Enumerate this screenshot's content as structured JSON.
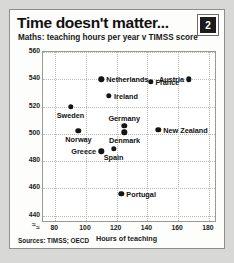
{
  "figure": {
    "title": "Time doesn't matter...",
    "badge": "2",
    "subtitle": "Maths: teaching hours per year v TIMSS score",
    "source": "Sources: TIMSS; OECD",
    "break_symbol": "≈"
  },
  "chart_data": {
    "type": "scatter",
    "title": "Time doesn't matter...",
    "subtitle": "Maths: teaching hours per year v TIMSS score",
    "xlabel": "Hours of teaching",
    "ylabel": "TIMSS score",
    "xlim": [
      72,
      184
    ],
    "ylim": [
      436,
      560
    ],
    "xticks": [
      80,
      100,
      120,
      140,
      160,
      180
    ],
    "yticks": [
      440,
      460,
      480,
      500,
      520,
      540,
      560
    ],
    "grid": true,
    "legend": "none",
    "axis_break": true,
    "points": [
      {
        "label": "Netherlands",
        "x": 110,
        "y": 540,
        "label_pos": "right"
      },
      {
        "label": "Austria",
        "x": 167,
        "y": 540,
        "label_pos": "left"
      },
      {
        "label": "Ireland",
        "x": 115,
        "y": 528,
        "label_pos": "right"
      },
      {
        "label": "France",
        "x": 142,
        "y": 538,
        "label_pos": "right"
      },
      {
        "label": "Sweden",
        "x": 90,
        "y": 520,
        "label_pos": "below"
      },
      {
        "label": "Germany",
        "x": 125,
        "y": 506,
        "label_pos": "above"
      },
      {
        "label": "New Zealand",
        "x": 147,
        "y": 503,
        "label_pos": "right"
      },
      {
        "label": "Norway",
        "x": 95,
        "y": 502,
        "label_pos": "below"
      },
      {
        "label": "Denmark",
        "x": 125,
        "y": 501,
        "label_pos": "below"
      },
      {
        "label": "Greece",
        "x": 110,
        "y": 487,
        "label_pos": "left"
      },
      {
        "label": "Spain",
        "x": 118,
        "y": 489,
        "label_pos": "below"
      },
      {
        "label": "Portugal",
        "x": 123,
        "y": 456,
        "label_pos": "right"
      }
    ]
  }
}
